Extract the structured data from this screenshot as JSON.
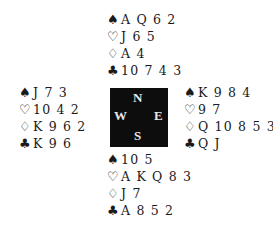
{
  "suits": {
    "spades": "♠",
    "hearts": "♡",
    "diamonds": "♢",
    "clubs": "♣"
  },
  "hands": {
    "north": {
      "spades": "A Q 6 2",
      "hearts": "J 6 5",
      "diamonds": "A 4",
      "clubs": "10 7 4 3"
    },
    "west": {
      "spades": "J 7 3",
      "hearts": "10 4 2",
      "diamonds": "K 9 6 2",
      "clubs": "K 9 6"
    },
    "east": {
      "spades": "K 9 8 4",
      "hearts": "9 7",
      "diamonds": "Q 10 8 5 3",
      "clubs": "Q J"
    },
    "south": {
      "spades": "10 5",
      "hearts": "A K Q 8 3",
      "diamonds": "J 7",
      "clubs": "A 8 5 2"
    }
  },
  "compass": {
    "north": "N",
    "south": "S",
    "west": "W",
    "east": "E",
    "background": "#0d0d0d"
  }
}
